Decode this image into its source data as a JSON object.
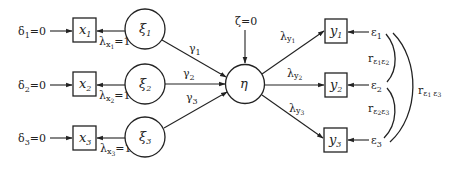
{
  "diagram": {
    "type": "structural-equation-model-path-diagram",
    "exogenous_latent": [
      {
        "id": "xi1",
        "symbol": "ξ",
        "sub": "1"
      },
      {
        "id": "xi2",
        "symbol": "ξ",
        "sub": "2"
      },
      {
        "id": "xi3",
        "symbol": "ξ",
        "sub": "3"
      }
    ],
    "endogenous_latent": {
      "id": "eta",
      "symbol": "η"
    },
    "disturbance": {
      "symbol": "ζ",
      "text": "=0"
    },
    "x_indicators": [
      {
        "id": "x1",
        "symbol": "x",
        "sub": "1",
        "error_symbol": "δ",
        "error_sub": "1",
        "error_text": "=0",
        "loading_symbol": "λ",
        "loading_sub": "x",
        "loading_subsub": "1",
        "loading_text": "=1"
      },
      {
        "id": "x2",
        "symbol": "x",
        "sub": "2",
        "error_symbol": "δ",
        "error_sub": "2",
        "error_text": "=0",
        "loading_symbol": "λ",
        "loading_sub": "x",
        "loading_subsub": "2",
        "loading_text": "=1"
      },
      {
        "id": "x3",
        "symbol": "x",
        "sub": "3",
        "error_symbol": "δ",
        "error_sub": "3",
        "error_text": "=0",
        "loading_symbol": "λ",
        "loading_sub": "x",
        "loading_subsub": "3",
        "loading_text": "=1"
      }
    ],
    "gammas": [
      {
        "symbol": "γ",
        "sub": "1"
      },
      {
        "symbol": "γ",
        "sub": "2"
      },
      {
        "symbol": "γ",
        "sub": "3"
      }
    ],
    "y_indicators": [
      {
        "id": "y1",
        "symbol": "y",
        "sub": "1",
        "error_symbol": "ε",
        "error_sub": "1",
        "loading_symbol": "λ",
        "loading_sub": "y",
        "loading_subsub": "1"
      },
      {
        "id": "y2",
        "symbol": "y",
        "sub": "2",
        "error_symbol": "ε",
        "error_sub": "2",
        "loading_symbol": "λ",
        "loading_sub": "y",
        "loading_subsub": "2"
      },
      {
        "id": "y3",
        "symbol": "y",
        "sub": "3",
        "error_symbol": "ε",
        "error_sub": "3",
        "loading_symbol": "λ",
        "loading_sub": "y",
        "loading_subsub": "3"
      }
    ],
    "error_correlations": [
      {
        "symbol": "r",
        "sub_a": "ε",
        "sub_a_idx": "1",
        "sub_b": "ε",
        "sub_b_idx": "2"
      },
      {
        "symbol": "r",
        "sub_a": "ε",
        "sub_a_idx": "2",
        "sub_b": "ε",
        "sub_b_idx": "3"
      },
      {
        "symbol": "r",
        "sub_a": "ε",
        "sub_a_idx": "1",
        "sub_b": "ε",
        "sub_b_idx": "3"
      }
    ]
  }
}
